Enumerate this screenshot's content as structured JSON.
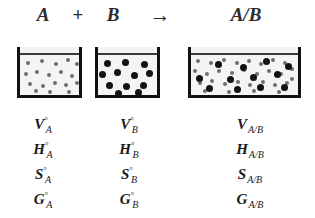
{
  "figure": {
    "background_color": "#ffffff"
  },
  "equation": {
    "reactant_a": "A",
    "operator_plus": "+",
    "reactant_b": "B",
    "operator_arrow": "→",
    "product": "A/B"
  },
  "beakers": [
    {
      "id": "beaker-a",
      "name": "beaker-a",
      "content_label": "A",
      "particle_kind": "gray-small",
      "particle_color": "#6e6e6e",
      "particle_count": 18,
      "particle_size": 4,
      "liquid_line_color": "#3a3a3a",
      "wall_color": "#111111"
    },
    {
      "id": "beaker-b",
      "name": "beaker-b",
      "content_label": "B",
      "particle_kind": "black-large",
      "particle_color": "#121212",
      "particle_count": 12,
      "particle_size": 7,
      "liquid_line_color": "#3a3a3a",
      "wall_color": "#111111"
    },
    {
      "id": "beaker-ab",
      "name": "beaker-ab",
      "content_label": "A/B",
      "particle_kind": "mixed",
      "particle_color_gray": "#6e6e6e",
      "particle_color_black": "#121212",
      "particle_count_gray": 30,
      "particle_count_black": 12,
      "particle_size_gray": 4,
      "particle_size_black": 7,
      "liquid_line_color": "#3a3a3a",
      "wall_color": "#111111"
    }
  ],
  "labels": {
    "column_a": {
      "subscript": "A",
      "superscript": "°",
      "properties": [
        {
          "symbol": "V",
          "superscript": "°",
          "subscript": "A"
        },
        {
          "symbol": "H",
          "superscript": "°",
          "subscript": "A"
        },
        {
          "symbol": "S",
          "superscript": "°",
          "subscript": "A"
        },
        {
          "symbol": "G",
          "superscript": "°",
          "subscript": "A"
        }
      ]
    },
    "column_b": {
      "subscript": "B",
      "superscript": "°",
      "properties": [
        {
          "symbol": "V",
          "superscript": "°",
          "subscript": "B"
        },
        {
          "symbol": "H",
          "superscript": "°",
          "subscript": "B"
        },
        {
          "symbol": "S",
          "superscript": "°",
          "subscript": "B"
        },
        {
          "symbol": "G",
          "superscript": "°",
          "subscript": "B"
        }
      ]
    },
    "column_ab": {
      "subscript": "A/B",
      "superscript": "",
      "properties": [
        {
          "symbol": "V",
          "superscript": "",
          "subscript": "A/B"
        },
        {
          "symbol": "H",
          "superscript": "",
          "subscript": "A/B"
        },
        {
          "symbol": "S",
          "superscript": "",
          "subscript": "A/B"
        },
        {
          "symbol": "G",
          "superscript": "",
          "subscript": "A/B"
        }
      ]
    }
  },
  "particle_layout": {
    "beaker_a": [
      [
        8,
        16
      ],
      [
        22,
        14
      ],
      [
        36,
        17
      ],
      [
        48,
        13
      ],
      [
        57,
        17
      ],
      [
        6,
        27
      ],
      [
        17,
        25
      ],
      [
        29,
        28
      ],
      [
        41,
        25
      ],
      [
        52,
        29
      ],
      [
        10,
        37
      ],
      [
        23,
        39
      ],
      [
        35,
        36
      ],
      [
        46,
        38
      ],
      [
        57,
        36
      ],
      [
        16,
        44
      ],
      [
        30,
        45
      ],
      [
        49,
        45
      ]
    ],
    "beaker_b": [
      [
        9,
        16
      ],
      [
        27,
        15
      ],
      [
        46,
        17
      ],
      [
        4,
        27
      ],
      [
        19,
        25
      ],
      [
        36,
        28
      ],
      [
        51,
        26
      ],
      [
        11,
        38
      ],
      [
        28,
        39
      ],
      [
        45,
        38
      ],
      [
        20,
        46
      ],
      [
        40,
        45
      ]
    ],
    "beaker_ab_gray": [
      [
        7,
        14
      ],
      [
        20,
        16
      ],
      [
        33,
        13
      ],
      [
        46,
        16
      ],
      [
        58,
        14
      ],
      [
        70,
        17
      ],
      [
        82,
        13
      ],
      [
        94,
        16
      ],
      [
        101,
        22
      ],
      [
        4,
        24
      ],
      [
        16,
        27
      ],
      [
        28,
        24
      ],
      [
        41,
        26
      ],
      [
        53,
        23
      ],
      [
        66,
        27
      ],
      [
        78,
        24
      ],
      [
        90,
        27
      ],
      [
        101,
        32
      ],
      [
        9,
        36
      ],
      [
        21,
        34
      ],
      [
        34,
        37
      ],
      [
        47,
        35
      ],
      [
        59,
        38
      ],
      [
        72,
        35
      ],
      [
        84,
        38
      ],
      [
        96,
        36
      ],
      [
        14,
        44
      ],
      [
        38,
        45
      ],
      [
        63,
        44
      ],
      [
        88,
        45
      ]
    ],
    "beaker_ab_black": [
      [
        27,
        17
      ],
      [
        52,
        20
      ],
      [
        75,
        14
      ],
      [
        97,
        19
      ],
      [
        8,
        31
      ],
      [
        39,
        32
      ],
      [
        62,
        30
      ],
      [
        86,
        27
      ],
      [
        18,
        41
      ],
      [
        46,
        42
      ],
      [
        69,
        40
      ],
      [
        93,
        40
      ]
    ]
  }
}
